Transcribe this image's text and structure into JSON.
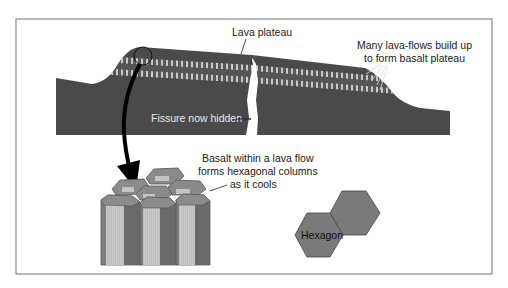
{
  "figure": {
    "type": "geology-diagram"
  },
  "labels": {
    "lava_plateau": "Lava plateau",
    "many_flows_line1": "Many lava-flows build up",
    "many_flows_line2": "to form basalt plateau",
    "fissure": "Fissure now hidden",
    "basalt_line1": "Basalt within a lava flow",
    "basalt_line2": "forms hexagonal columns",
    "basalt_line3": "as it cools",
    "hexagon": "Hexagon"
  },
  "colors": {
    "frame": "#8a8a8a",
    "rock_dark": "#4a4a4a",
    "rock_band": "#5e5e5e",
    "stripe_light": "#cfcfcf",
    "column_mid": "#7d7d7d",
    "column_dark": "#6a6a6a",
    "column_light": "#c8c8c8",
    "column_top": "#8c8c8c",
    "hexagon_fill": "#7a7a7a",
    "arrow": "#000000"
  }
}
